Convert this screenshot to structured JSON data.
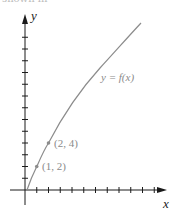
{
  "caption_fragment": "shown in",
  "axes": {
    "x_label": "x",
    "y_label": "y",
    "origin_px": [
      25,
      190
    ],
    "tick_spacing_px": 11.75,
    "x_tick_count": 11,
    "y_tick_count": 13
  },
  "curve": {
    "label": "y = f(x)",
    "color": "#8c8c8c"
  },
  "points": [
    {
      "label": "(1, 2)",
      "x": 1,
      "y": 2
    },
    {
      "label": "(2, 4)",
      "x": 2,
      "y": 4
    }
  ],
  "colors": {
    "axis": "#1a1a1a",
    "label": "#8a8a8a",
    "point": "#8c8c8c"
  }
}
